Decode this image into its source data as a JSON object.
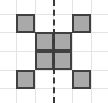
{
  "figure": {
    "title": "",
    "width": 108,
    "height": 103,
    "background_color": "#ffffff"
  },
  "grid": {
    "line_color": "#e4e4e4",
    "vertical_positions": [
      16,
      35,
      53,
      72,
      91
    ],
    "horizontal_positions": [
      14,
      32,
      51,
      70,
      88
    ],
    "columns": 4,
    "rows": 4,
    "cell_size": 19
  },
  "shape": {
    "fill_color": "#a9a9a9",
    "stroke_color": "#404040",
    "stroke_width": 2,
    "filled_cells": [
      {
        "name": "top-left-square",
        "col": 0,
        "row": 0,
        "x": 16,
        "y": 14
      },
      {
        "name": "top-right-square",
        "col": 3,
        "row": 0,
        "x": 72,
        "y": 14
      },
      {
        "name": "center-upper-left-square",
        "col": 1,
        "row": 1,
        "x": 35,
        "y": 32
      },
      {
        "name": "center-upper-right-square",
        "col": 2,
        "row": 1,
        "x": 53,
        "y": 32
      },
      {
        "name": "center-lower-left-square",
        "col": 1,
        "row": 2,
        "x": 35,
        "y": 51
      },
      {
        "name": "center-lower-right-square",
        "col": 2,
        "row": 2,
        "x": 53,
        "y": 51
      },
      {
        "name": "bottom-left-square",
        "col": 0,
        "row": 3,
        "x": 16,
        "y": 70
      },
      {
        "name": "bottom-right-square",
        "col": 3,
        "row": 3,
        "x": 72,
        "y": 70
      }
    ]
  },
  "symmetry_line": {
    "orientation": "vertical",
    "x": 53,
    "color": "#3a3a3a",
    "style": "dashed",
    "width": 2
  }
}
